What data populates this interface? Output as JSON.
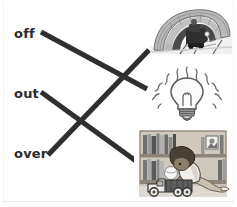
{
  "worksheet": {
    "type": "matching-exercise",
    "title": "",
    "instructions": "",
    "background_color": "#ffffff",
    "line_color": "#2f2f2f",
    "text_color": "#2b2b2b"
  },
  "words": [
    {
      "id": "off",
      "label": "off"
    },
    {
      "id": "out",
      "label": "out"
    },
    {
      "id": "over",
      "label": "over"
    }
  ],
  "pictures": [
    {
      "id": "tunnel",
      "name": "train-in-tunnel-picture",
      "description": "train engine coming out of a stone arch tunnel"
    },
    {
      "id": "bulb",
      "name": "light-bulb-picture",
      "description": "glowing light bulb with rays"
    },
    {
      "id": "bookshelf",
      "name": "child-with-toy-truck-picture",
      "description": "child kneeling with a toy truck in front of a bookshelf"
    }
  ],
  "connections": [
    {
      "from": "off",
      "to": "bulb",
      "label": "off-to-bulb"
    },
    {
      "from": "out",
      "to": "bookshelf",
      "label": "out-to-bookshelf"
    },
    {
      "from": "over",
      "to": "tunnel",
      "label": "over-to-tunnel"
    }
  ]
}
